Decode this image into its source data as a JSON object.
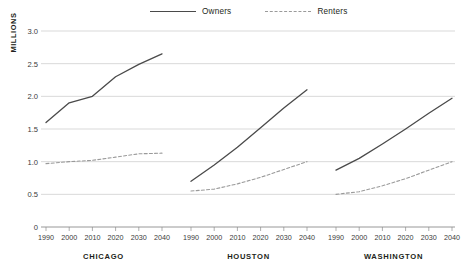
{
  "chart_data": {
    "type": "line",
    "title": "",
    "subtitle": "",
    "ylabel": "MILLIONS",
    "xlabel": "",
    "ylim": [
      0,
      3.0
    ],
    "yticks": [
      "0",
      "0.5",
      "1.0",
      "1.5",
      "2.0",
      "2.5",
      "3.0"
    ],
    "ytick_values": [
      0,
      0.5,
      1.0,
      1.5,
      2.0,
      2.5,
      3.0
    ],
    "xlim": [
      1990,
      2040
    ],
    "x": [
      1990,
      2000,
      2010,
      2020,
      2030,
      2040
    ],
    "xtick_labels": [
      "1990",
      "2000",
      "2010",
      "2020",
      "2030",
      "2040"
    ],
    "grid": true,
    "legend_position": "top-center",
    "legend": [
      {
        "name": "Owners",
        "style": "solid",
        "color": "#4a4a4a"
      },
      {
        "name": "Renters",
        "style": "dashed",
        "color": "#9a9a9a"
      }
    ],
    "panels": [
      {
        "label": "CHICAGO",
        "series": [
          {
            "name": "Owners",
            "style": "solid",
            "values": [
              1.6,
              1.9,
              2.0,
              2.3,
              2.49,
              2.65
            ]
          },
          {
            "name": "Renters",
            "style": "dashed",
            "values": [
              0.97,
              1.0,
              1.02,
              1.07,
              1.12,
              1.13
            ]
          }
        ]
      },
      {
        "label": "HOUSTON",
        "series": [
          {
            "name": "Owners",
            "style": "solid",
            "values": [
              0.7,
              0.95,
              1.22,
              1.52,
              1.82,
              2.1
            ]
          },
          {
            "name": "Renters",
            "style": "dashed",
            "values": [
              0.55,
              0.58,
              0.66,
              0.76,
              0.88,
              1.0
            ]
          }
        ]
      },
      {
        "label": "WASHINGTON",
        "series": [
          {
            "name": "Owners",
            "style": "solid",
            "values": [
              0.87,
              1.05,
              1.27,
              1.5,
              1.74,
              1.97
            ]
          },
          {
            "name": "Renters",
            "style": "dashed",
            "values": [
              0.5,
              0.54,
              0.63,
              0.74,
              0.87,
              1.0
            ]
          }
        ]
      }
    ]
  }
}
